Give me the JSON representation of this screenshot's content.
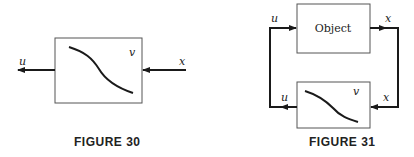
{
  "figure30": {
    "caption": "FIGURE 30",
    "block_label": "v",
    "input_label": "x",
    "output_label": "u"
  },
  "figure31": {
    "caption": "FIGURE 31",
    "object_label": "Object",
    "controller_label": "v",
    "labels": {
      "object_input": "u",
      "object_output": "x",
      "controller_input": "x",
      "controller_output": "u"
    }
  },
  "colors": {
    "line": "#1a1a1a",
    "box": "#555555"
  }
}
